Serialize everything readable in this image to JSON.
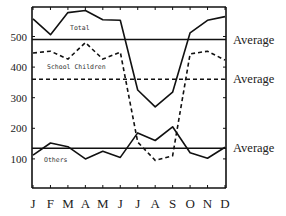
{
  "chart_data": {
    "type": "line",
    "title": "",
    "xlabel": "",
    "ylabel": "",
    "categories": [
      "J",
      "F",
      "M",
      "A",
      "M",
      "J",
      "J",
      "A",
      "S",
      "O",
      "N",
      "D"
    ],
    "ylim": [
      0,
      600
    ],
    "yticks": [
      100,
      200,
      300,
      400,
      500
    ],
    "grid": false,
    "series": [
      {
        "name": "Total",
        "style": "solid",
        "values": [
          558,
          506,
          578,
          585,
          555,
          553,
          325,
          270,
          318,
          512,
          553,
          565
        ],
        "average": 490
      },
      {
        "name": "School Children",
        "style": "dashed",
        "values": [
          446,
          452,
          426,
          480,
          426,
          449,
          155,
          95,
          110,
          443,
          452,
          423
        ],
        "average": 360
      },
      {
        "name": "Others",
        "style": "solid",
        "values": [
          112,
          152,
          140,
          100,
          125,
          105,
          185,
          160,
          205,
          120,
          102,
          138
        ],
        "average": 135
      }
    ],
    "annotations": [
      "Average",
      "Average",
      "Average"
    ]
  },
  "labels": {
    "total": "Total",
    "school": "School Children",
    "others": "Others",
    "average": "Average"
  },
  "ticks": {
    "y": [
      "500",
      "400",
      "300",
      "200",
      "100"
    ],
    "x": [
      "J",
      "F",
      "M",
      "A",
      "M",
      "J",
      "J",
      "A",
      "S",
      "O",
      "N",
      "D"
    ]
  }
}
